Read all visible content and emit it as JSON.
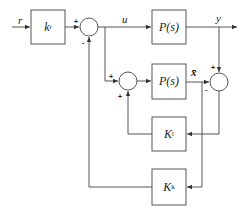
{
  "diagram": {
    "type": "block-diagram",
    "line_color": "#444444",
    "signals": {
      "r": "r",
      "u": "u",
      "y": "y",
      "xbar": "x̄"
    },
    "blocks": {
      "kr": {
        "label": "k",
        "sub": "r"
      },
      "plant_top": {
        "label": "P(s)"
      },
      "plant_bottom": {
        "label": "P(s)"
      },
      "kl": {
        "label": "K",
        "sub": "l"
      },
      "kk": {
        "label": "K",
        "sub": "k"
      }
    },
    "summing_junctions": {
      "sum1": {
        "in_left": "+",
        "in_bottom": "-"
      },
      "sum2": {
        "in_left": "+",
        "in_bottom": "+"
      },
      "sum3": {
        "in_top": "+",
        "in_left": "-"
      }
    }
  }
}
